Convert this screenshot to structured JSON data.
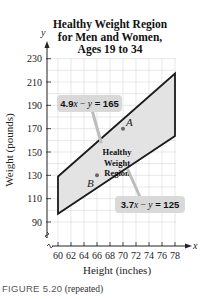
{
  "chart_data": {
    "type": "area",
    "title_lines": [
      "Healthy Weight Region",
      "for Men and Women,",
      "Ages 19 to 34"
    ],
    "xlabel": "Height (inches)",
    "ylabel": "Weight (pounds)",
    "x_axis_symbol": "x",
    "y_axis_symbol": "y",
    "xlim": [
      60,
      78
    ],
    "ylim": [
      90,
      230
    ],
    "x_ticks": [
      60,
      62,
      64,
      66,
      68,
      70,
      72,
      74,
      76,
      78
    ],
    "y_ticks": [
      90,
      110,
      130,
      150,
      170,
      190,
      210,
      230
    ],
    "grid": true,
    "region": {
      "label_lines": [
        "Healthy",
        "Weight",
        "Region"
      ],
      "vertices": [
        [
          60,
          129
        ],
        [
          78,
          217.2
        ],
        [
          78,
          163.6
        ],
        [
          60,
          97
        ]
      ],
      "fill": "#e3e3e3",
      "stroke": "#1a1a1a"
    },
    "lines": [
      {
        "equation": "4.9x − y = 165",
        "eq_lhs_a": "4.9",
        "eq_var_x": "x",
        "eq_minus": " − ",
        "eq_var_y": "y",
        "eq_rhs": " = 165",
        "x": [
          60,
          78
        ],
        "y": [
          129,
          217.2
        ]
      },
      {
        "equation": "3.7x − y = 125",
        "eq_lhs_a": "3.7",
        "eq_var_x": "x",
        "eq_minus": " − ",
        "eq_var_y": "y",
        "eq_rhs": " = 125",
        "x": [
          60,
          78
        ],
        "y": [
          97,
          163.6
        ]
      }
    ],
    "points": [
      {
        "label": "A",
        "x": 70,
        "y": 170
      },
      {
        "label": "B",
        "x": 66,
        "y": 130
      }
    ]
  },
  "caption": {
    "figure": "FIGURE 5.20",
    "note": "(repeated)"
  }
}
